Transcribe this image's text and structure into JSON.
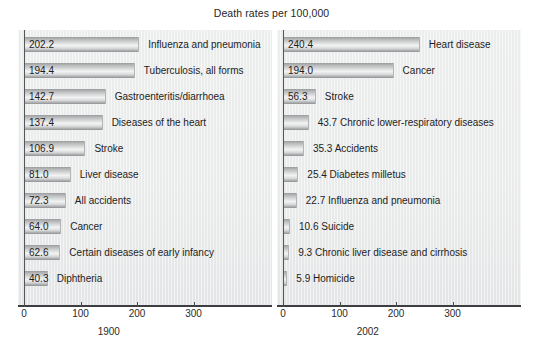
{
  "chart_title": "Death rates per 100,000",
  "axis": {
    "ticks": [
      0,
      100,
      200,
      300
    ],
    "tick_labels": [
      "0",
      "100",
      "200",
      "300"
    ],
    "xmax": 380,
    "unit_px": 0.565
  },
  "panels": [
    {
      "caption": "1900",
      "rows": [
        {
          "value": "202.2",
          "v": 202.2,
          "label": "Influenza and pneumonia",
          "value_inside": true
        },
        {
          "value": "194.4",
          "v": 194.4,
          "label": "Tuberculosis, all forms",
          "value_inside": true
        },
        {
          "value": "142.7",
          "v": 142.7,
          "label": "Gastroenteritis/diarrhoea",
          "value_inside": true
        },
        {
          "value": "137.4",
          "v": 137.4,
          "label": "Diseases of the heart",
          "value_inside": true
        },
        {
          "value": "106.9",
          "v": 106.9,
          "label": "Stroke",
          "value_inside": true
        },
        {
          "value": "81.0",
          "v": 81.0,
          "label": "Liver disease",
          "value_inside": true
        },
        {
          "value": "72.3",
          "v": 72.3,
          "label": "All accidents",
          "value_inside": true
        },
        {
          "value": "64.0",
          "v": 64.0,
          "label": "Cancer",
          "value_inside": true
        },
        {
          "value": "62.6",
          "v": 62.6,
          "label": "Certain diseases of early infancy",
          "value_inside": true
        },
        {
          "value": "40.3",
          "v": 40.3,
          "label": "Diphtheria",
          "value_inside": true
        }
      ]
    },
    {
      "caption": "2002",
      "rows": [
        {
          "value": "240.4",
          "v": 240.4,
          "label": "Heart disease",
          "value_inside": true
        },
        {
          "value": "194.0",
          "v": 194.0,
          "label": "Cancer",
          "value_inside": true
        },
        {
          "value": "56.3",
          "v": 56.3,
          "label": "Stroke",
          "value_inside": true
        },
        {
          "value": "43.7",
          "v": 43.7,
          "label": "Chronic lower-respiratory diseases",
          "value_inside": false
        },
        {
          "value": "35.3",
          "v": 35.3,
          "label": "Accidents",
          "value_inside": false
        },
        {
          "value": "25.4",
          "v": 25.4,
          "label": "Diabetes milletus",
          "value_inside": false
        },
        {
          "value": "22.7",
          "v": 22.7,
          "label": "Influenza and pneumonia",
          "value_inside": false
        },
        {
          "value": "10.6",
          "v": 10.6,
          "label": "Suicide",
          "value_inside": false
        },
        {
          "value": "9.3",
          "v": 9.3,
          "label": "Chronic liver disease and cirrhosis",
          "value_inside": false
        },
        {
          "value": "5.9",
          "v": 5.9,
          "label": "Homicide",
          "value_inside": false
        }
      ]
    }
  ],
  "chart_data": {
    "type": "bar",
    "orientation": "horizontal",
    "title": "Death rates per 100,000",
    "xlabel": "",
    "ylabel": "",
    "xlim": [
      0,
      380
    ],
    "xticks": [
      0,
      100,
      200,
      300
    ],
    "grid": false,
    "legend": "none",
    "panels": [
      {
        "name": "1900",
        "categories": [
          "Influenza and pneumonia",
          "Tuberculosis, all forms",
          "Gastroenteritis/diarrhoea",
          "Diseases of the heart",
          "Stroke",
          "Liver disease",
          "All accidents",
          "Cancer",
          "Certain diseases of early infancy",
          "Diphtheria"
        ],
        "values": [
          202.2,
          194.4,
          142.7,
          137.4,
          106.9,
          81.0,
          72.3,
          64.0,
          62.6,
          40.3
        ]
      },
      {
        "name": "2002",
        "categories": [
          "Heart disease",
          "Cancer",
          "Stroke",
          "Chronic lower-respiratory diseases",
          "Accidents",
          "Diabetes milletus",
          "Influenza and pneumonia",
          "Suicide",
          "Chronic liver disease and cirrhosis",
          "Homicide"
        ],
        "values": [
          240.4,
          194.0,
          56.3,
          43.7,
          35.3,
          25.4,
          22.7,
          10.6,
          9.3,
          5.9
        ]
      }
    ]
  }
}
